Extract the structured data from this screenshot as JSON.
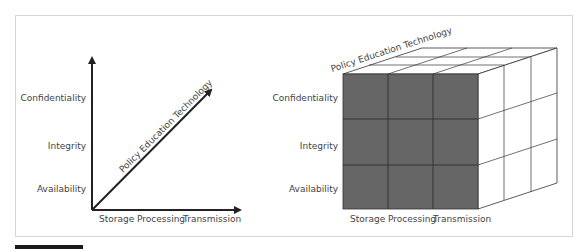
{
  "figure": {
    "left_diagram": {
      "type": "axes",
      "y_axis_labels": [
        "Confidentiality",
        "Integrity",
        "Availability"
      ],
      "x_axis_labels": [
        "Storage",
        "Processing",
        "Transmission"
      ],
      "diagonal_axis_label": "Policy Education Technology"
    },
    "right_diagram": {
      "type": "cube",
      "y_axis_labels": [
        "Confidentiality",
        "Integrity",
        "Availability"
      ],
      "x_axis_labels": [
        "Storage",
        "Processing",
        "Transmission"
      ],
      "depth_axis_label": "Policy Education Technology",
      "grid": "3x3x3"
    },
    "colors": {
      "axis": "#222222",
      "label_text": "#444444",
      "cube_front_fill": "#666666",
      "cube_line": "#333333",
      "frame_border": "#d6d6d6"
    }
  }
}
